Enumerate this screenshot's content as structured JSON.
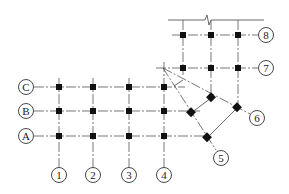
{
  "diagram": {
    "type": "structural-axis-grid",
    "colors": {
      "line": "#555555",
      "column": "#111111",
      "bubble_stroke": "#333333",
      "background": "#ffffff"
    },
    "row_axes": [
      {
        "label": "C",
        "y": 87
      },
      {
        "label": "B",
        "y": 111
      },
      {
        "label": "A",
        "y": 136
      }
    ],
    "column_axes": [
      {
        "label": "1",
        "x": 59
      },
      {
        "label": "2",
        "x": 93
      },
      {
        "label": "3",
        "x": 129
      },
      {
        "label": "4",
        "x": 164
      }
    ],
    "upper_axes": [
      {
        "label": "8",
        "y": 35
      },
      {
        "label": "7",
        "y": 68
      }
    ],
    "radial_axes": [
      {
        "label": "6"
      },
      {
        "label": "5"
      }
    ],
    "break_line": {
      "description": "top break line with break symbol"
    }
  }
}
